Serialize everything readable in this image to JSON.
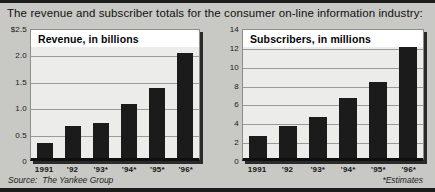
{
  "headline": "The revenue and subscriber totals for the consumer on-line information industry:",
  "source": {
    "label": "Source:",
    "name": "The Yankee Group"
  },
  "footnote": "*Estimates",
  "colors": {
    "bar": "#1b1b1b",
    "plot_bg": "#ececeb",
    "page_bg": "#c8c8c4",
    "grid": "#9a9a97"
  },
  "chart_data": [
    {
      "type": "bar",
      "title": "Revenue, in billions",
      "categories": [
        "1991",
        "'92",
        "'93*",
        "'94*",
        "'95*",
        "'96*"
      ],
      "values": [
        0.3,
        0.62,
        0.68,
        1.05,
        1.35,
        2.03
      ],
      "ticks": [
        "$2.5",
        "2.0",
        "1.5",
        "1.0",
        "0.5",
        "0"
      ],
      "tick_values": [
        2.5,
        2.0,
        1.5,
        1.0,
        0.5,
        0
      ],
      "ylim": [
        0,
        2.5
      ],
      "xlabel": "",
      "ylabel": "",
      "grid": true,
      "legend": "none"
    },
    {
      "type": "bar",
      "title": "Subscribers, in millions",
      "categories": [
        "1991",
        "'92",
        "'93*",
        "'94*",
        "'95*",
        "'96*"
      ],
      "values": [
        2.4,
        3.5,
        4.4,
        6.5,
        8.2,
        12.2
      ],
      "ticks": [
        "14",
        "12",
        "10",
        "8",
        "6",
        "4",
        "2",
        "0"
      ],
      "tick_values": [
        14,
        12,
        10,
        8,
        6,
        4,
        2,
        0
      ],
      "ylim": [
        0,
        14
      ],
      "xlabel": "",
      "ylabel": "",
      "grid": true,
      "legend": "none"
    }
  ]
}
